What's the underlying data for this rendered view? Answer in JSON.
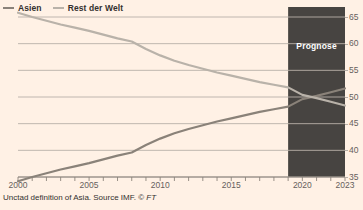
{
  "legend": {
    "items": [
      {
        "label": "Asien",
        "color": "#8a8279",
        "icon": "line-swatch"
      },
      {
        "label": "Rest der Welt",
        "color": "#b9b2a9",
        "icon": "line-swatch"
      }
    ]
  },
  "forecast": {
    "label": "Prognose",
    "start_year": 2019,
    "end_year": 2023,
    "band_color": "#474441",
    "text_color": "#ffffff"
  },
  "footer": {
    "text": "Unctad definition of Asia. Source IMF. ",
    "ft": "FT",
    "copyright": "© "
  },
  "axis": {
    "y_ticks": [
      35,
      40,
      45,
      50,
      55,
      60,
      65
    ],
    "y_tick_labels": [
      "35",
      "40",
      "45",
      "50",
      "55",
      "60",
      "65"
    ],
    "x_tick_labels": [
      "2000",
      "2005",
      "2010",
      "2015",
      "2020",
      "2023"
    ],
    "x_tick_values": [
      2000,
      2005,
      2010,
      2015,
      2020,
      2023
    ],
    "grid_color": "#b8b0a8"
  },
  "chart_data": {
    "type": "line",
    "title": "",
    "subtitle": "",
    "xlabel": "",
    "ylabel": "",
    "xlim": [
      2000,
      2023
    ],
    "ylim": [
      33,
      66.5
    ],
    "grid": true,
    "legend_position": "top-left",
    "x": [
      2000,
      2001,
      2002,
      2003,
      2004,
      2005,
      2006,
      2007,
      2008,
      2009,
      2010,
      2011,
      2012,
      2013,
      2014,
      2015,
      2016,
      2017,
      2018,
      2019,
      2020,
      2021,
      2022,
      2023
    ],
    "series": [
      {
        "name": "Asien",
        "color": "#8a8279",
        "values": [
          34.2,
          35.0,
          35.7,
          36.4,
          37.0,
          37.6,
          38.3,
          39.0,
          39.6,
          41.0,
          42.2,
          43.2,
          44.0,
          44.7,
          45.4,
          46.0,
          46.6,
          47.2,
          47.7,
          48.2,
          49.6,
          50.2,
          50.9,
          51.6
        ]
      },
      {
        "name": "Rest der Welt",
        "color": "#b9b2a9",
        "values": [
          65.8,
          65.0,
          64.3,
          63.6,
          63.0,
          62.4,
          61.7,
          61.0,
          60.4,
          59.0,
          57.8,
          56.8,
          56.0,
          55.3,
          54.6,
          54.0,
          53.4,
          52.8,
          52.3,
          51.8,
          50.4,
          49.8,
          49.1,
          48.4
        ]
      }
    ],
    "annotations": [
      {
        "text": "Prognose",
        "type": "shaded-band",
        "x_start": 2019,
        "x_end": 2023
      }
    ]
  }
}
